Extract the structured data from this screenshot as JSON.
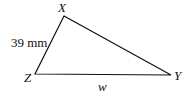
{
  "diagram": {
    "type": "triangle",
    "vertices": {
      "X": {
        "label": "X",
        "x": 64,
        "y": 16
      },
      "Y": {
        "label": "Y",
        "x": 171,
        "y": 75
      },
      "Z": {
        "label": "Z",
        "x": 35,
        "y": 74
      }
    },
    "sides": {
      "XZ": {
        "label": "39 mm"
      },
      "ZY": {
        "label": "w"
      }
    },
    "stroke_color": "#111111"
  }
}
